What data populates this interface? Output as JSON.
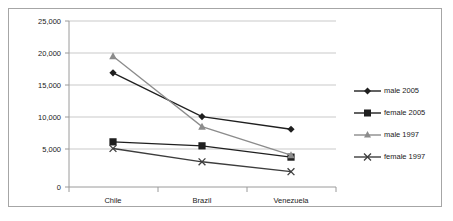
{
  "chart_data": {
    "type": "line",
    "title": "",
    "subtitle": "",
    "xlabel": "",
    "ylabel": "",
    "categories": [
      "Chile",
      "Brazil",
      "Venezuela"
    ],
    "ylim": [
      0,
      25000
    ],
    "y_ticks": [
      0,
      5000,
      10000,
      15000,
      20000,
      25000
    ],
    "y_tick_labels": [
      "0",
      "5,000",
      "10,000",
      "15,000",
      "20,000",
      "25,000"
    ],
    "grid": true,
    "legend_position": "right",
    "series": [
      {
        "name": "male 2005",
        "marker": "diamond",
        "color": "#1f1f1f",
        "values": [
          17200,
          10600,
          8700
        ]
      },
      {
        "name": "female 2005",
        "marker": "square",
        "color": "#1f1f1f",
        "values": [
          6800,
          6200,
          4500
        ]
      },
      {
        "name": "male 1997",
        "marker": "triangle",
        "color": "#8c8c8c",
        "values": [
          19700,
          9100,
          4800
        ]
      },
      {
        "name": "female 1997",
        "marker": "x",
        "color": "#3d3d3d",
        "values": [
          5800,
          3800,
          2300
        ]
      }
    ]
  },
  "axis": {
    "y_labels": [
      "25,000",
      "20,000",
      "15,000",
      "10,000",
      "5,000",
      "0"
    ],
    "x_labels": [
      "Chile",
      "Brazil",
      "Venezuela"
    ]
  },
  "legend": {
    "entries": [
      {
        "label": "male 2005",
        "marker": "diamond-marker-icon"
      },
      {
        "label": "female 2005",
        "marker": "square-marker-icon"
      },
      {
        "label": "male 1997",
        "marker": "triangle-marker-icon"
      },
      {
        "label": "female 1997",
        "marker": "x-marker-icon"
      }
    ]
  },
  "colors": {
    "gridline": "#c9c9c9",
    "border": "#a6a6a6",
    "dark_series": "#1f1f1f",
    "gray_series": "#8c8c8c"
  }
}
